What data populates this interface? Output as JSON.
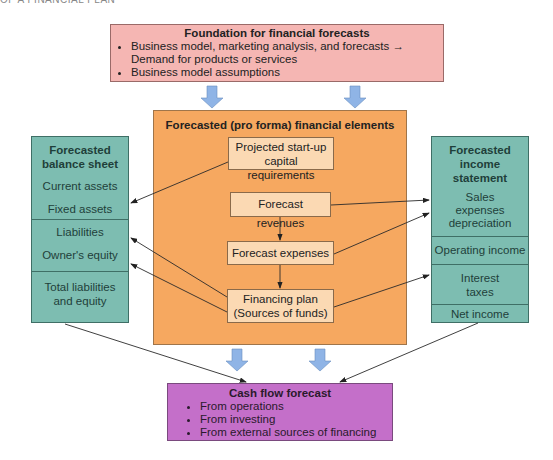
{
  "header_cut": "OF A FINANCIAL PLAN",
  "foundation": {
    "title": "Foundation for financial forecasts",
    "bullet1_part1": "Business model, marketing analysis, and forecasts",
    "bullet1_arrow": "→",
    "bullet1_part2": "Demand for products or services",
    "bullet2": "Business model assumptions"
  },
  "pro_forma": {
    "title": "Forecasted (pro forma) financial elements",
    "items": [
      "Projected start-up capital requirements",
      "Forecast revenues",
      "Forecast expenses",
      "Financing plan (Sources of funds)"
    ]
  },
  "balance_sheet": {
    "title": "Forecasted balance sheet",
    "items": [
      "Current assets",
      "Fixed assets",
      "Liabilities",
      "Owner's equity",
      "Total liabilities and equity"
    ]
  },
  "income_statement": {
    "title": "Forecasted income statement",
    "items": [
      "Sales expenses depreciation",
      "Operating income",
      "Interest taxes",
      "Net income"
    ]
  },
  "cash_flow": {
    "title": "Cash flow forecast",
    "items": [
      "From operations",
      "From investing",
      "From external sources of financing"
    ]
  },
  "colors": {
    "foundation": "#f5b6b3",
    "pro_forma": "#f6a860",
    "inner_box": "#fbd9b3",
    "statements": "#7dbdb1",
    "cash_flow": "#c46fc9",
    "block_arrow": "#8fb4e6"
  }
}
